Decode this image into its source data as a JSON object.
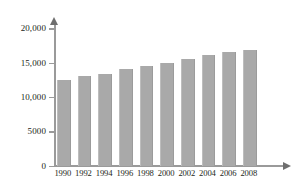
{
  "chart_data": {
    "type": "bar",
    "title": "",
    "xlabel": "",
    "ylabel": "",
    "categories": [
      "1990",
      "1992",
      "1994",
      "1996",
      "1998",
      "2000",
      "2002",
      "2004",
      "2006",
      "2008"
    ],
    "values": [
      12500,
      13000,
      13400,
      14100,
      14500,
      14900,
      15500,
      16100,
      16500,
      16800
    ],
    "series": [
      {
        "name": "",
        "values": [
          12500,
          13000,
          13400,
          14100,
          14500,
          14900,
          15500,
          16100,
          16500,
          16800
        ]
      }
    ],
    "ylim": [
      0,
      20000
    ],
    "y_ticks": [
      0,
      5000,
      10000,
      15000,
      20000
    ],
    "y_tick_labels": [
      "0",
      "5000",
      "10,000",
      "15,000",
      "20,000"
    ],
    "x_tick_labels": [
      "1990",
      "1992",
      "1994",
      "1996",
      "1998",
      "2000",
      "2002",
      "2004",
      "2006",
      "2008"
    ],
    "grid": false,
    "legend": null,
    "legend_position": "none",
    "annotations": [],
    "bar_color": "#a9a9a9",
    "axis_color": "#9a9a9a",
    "text_color": "#231f20",
    "background_color": "#ffffff"
  }
}
